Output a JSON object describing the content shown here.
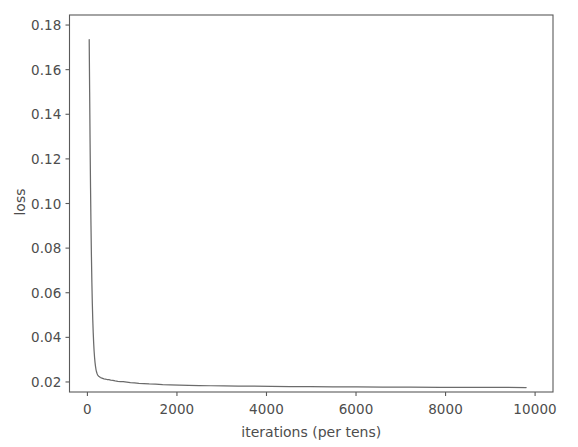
{
  "chart_data": {
    "type": "line",
    "title": "",
    "xlabel": "iterations (per tens)",
    "ylabel": "loss",
    "xlim": [
      -400,
      10400
    ],
    "ylim": [
      0.0155,
      0.1845
    ],
    "xticks": [
      0,
      2000,
      4000,
      6000,
      8000,
      10000
    ],
    "xtick_labels": [
      "0",
      "2000",
      "4000",
      "6000",
      "8000",
      "10000"
    ],
    "yticks": [
      0.02,
      0.04,
      0.06,
      0.08,
      0.1,
      0.12,
      0.14,
      0.16,
      0.18
    ],
    "ytick_labels": [
      "0.02",
      "0.04",
      "0.06",
      "0.08",
      "0.10",
      "0.12",
      "0.14",
      "0.16",
      "0.18"
    ],
    "grid": false,
    "legend": null,
    "line_color": "#6b6b6b",
    "frame_color": "#5a5a5a",
    "text_color": "#4d4d4d",
    "series": [
      {
        "name": "loss",
        "x": [
          40,
          50,
          60,
          70,
          80,
          90,
          100,
          110,
          120,
          130,
          140,
          150,
          160,
          170,
          180,
          190,
          200,
          215,
          230,
          250,
          270,
          290,
          310,
          340,
          370,
          400,
          440,
          480,
          520,
          570,
          620,
          680,
          740,
          800,
          880,
          960,
          1050,
          1150,
          1260,
          1380,
          1520,
          1680,
          1850,
          2050,
          2260,
          2500,
          2760,
          3050,
          3370,
          3720,
          4100,
          4520,
          4980,
          5480,
          6020,
          6600,
          7220,
          7880,
          8580,
          9200,
          9800
        ],
        "y": [
          0.1735,
          0.15,
          0.127,
          0.107,
          0.09,
          0.076,
          0.0645,
          0.0552,
          0.0478,
          0.042,
          0.0374,
          0.0338,
          0.031,
          0.0288,
          0.0271,
          0.0258,
          0.0248,
          0.0238,
          0.0231,
          0.0226,
          0.0223,
          0.022,
          0.0218,
          0.0216,
          0.0214,
          0.0213,
          0.0211,
          0.021,
          0.0208,
          0.0207,
          0.0205,
          0.0203,
          0.0202,
          0.0201,
          0.0199,
          0.0197,
          0.0196,
          0.0194,
          0.0193,
          0.0191,
          0.019,
          0.0188,
          0.0187,
          0.0186,
          0.0185,
          0.0184,
          0.0183,
          0.0182,
          0.0181,
          0.0181,
          0.018,
          0.0179,
          0.0179,
          0.0178,
          0.0178,
          0.0177,
          0.0177,
          0.0176,
          0.0176,
          0.0176,
          0.0175
        ]
      }
    ]
  }
}
